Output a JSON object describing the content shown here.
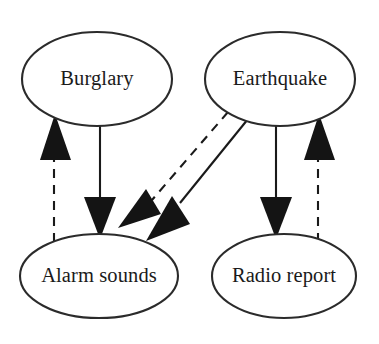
{
  "diagram": {
    "type": "causal-bayesian-network",
    "canvas": {
      "width": 379,
      "height": 344,
      "background": "#ffffff"
    },
    "style": {
      "node_fill": "#ffffff",
      "node_stroke": "#2b2b2b",
      "edge_color": "#1a1a1a",
      "arrow_fill": "#141414",
      "label_color": "#1a1a1a"
    },
    "nodes": [
      {
        "id": "burglary",
        "label": "Burglary",
        "shape": "ellipse",
        "cx": 97,
        "cy": 79,
        "rx": 75,
        "ry": 47
      },
      {
        "id": "earthquake",
        "label": "Earthquake",
        "shape": "ellipse",
        "cx": 280,
        "cy": 79,
        "rx": 75,
        "ry": 47
      },
      {
        "id": "alarm_sounds",
        "label": "Alarm sounds",
        "shape": "ellipse",
        "cx": 99,
        "cy": 276,
        "rx": 79,
        "ry": 42
      },
      {
        "id": "radio_report",
        "label": "Radio report",
        "shape": "ellipse",
        "cx": 284,
        "cy": 276,
        "rx": 72,
        "ry": 42
      }
    ],
    "edges": [
      {
        "id": "edge-burglary-to-alarm",
        "from": "burglary",
        "to": "alarm_sounds",
        "line_style": "solid",
        "direction": "down",
        "x1": 100,
        "y1": 126,
        "x2": 100,
        "y2": 234,
        "arrow_at": "end"
      },
      {
        "id": "edge-alarm-to-burglary",
        "from": "alarm_sounds",
        "to": "burglary",
        "line_style": "dashed",
        "direction": "up",
        "x1": 54,
        "y1": 238,
        "x2": 54,
        "y2": 118,
        "arrow_at": "end"
      },
      {
        "id": "edge-earthquake-to-alarm-solid",
        "from": "earthquake",
        "to": "alarm_sounds",
        "line_style": "solid",
        "direction": "down-left",
        "x1": 244,
        "y1": 120,
        "x2": 154,
        "y2": 233,
        "arrow_at": "end"
      },
      {
        "id": "edge-earthquake-to-alarm-dashed",
        "from": "earthquake",
        "to": "alarm_sounds",
        "line_style": "dashed",
        "direction": "down-left",
        "x1": 224,
        "y1": 111,
        "x2": 134,
        "y2": 215,
        "arrow_at": "end"
      },
      {
        "id": "edge-earthquake-to-radio",
        "from": "earthquake",
        "to": "radio_report",
        "line_style": "solid",
        "direction": "down",
        "x1": 276,
        "y1": 126,
        "x2": 276,
        "y2": 234,
        "arrow_at": "end"
      },
      {
        "id": "edge-radio-to-earthquake",
        "from": "radio_report",
        "to": "earthquake",
        "line_style": "dashed",
        "direction": "up",
        "x1": 318,
        "y1": 238,
        "x2": 318,
        "y2": 118,
        "arrow_at": "end"
      }
    ]
  }
}
